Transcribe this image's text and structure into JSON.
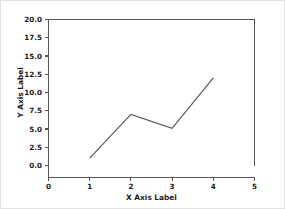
{
  "chart_data": {
    "type": "line",
    "title": "",
    "xlabel": "X Axis Label",
    "ylabel": "Y Axis Label",
    "xlim": [
      0,
      5
    ],
    "ylim": [
      0.0,
      20.0
    ],
    "grid": false,
    "legend": null,
    "x": [
      1,
      2,
      3,
      4
    ],
    "values": [
      1.0,
      7.0,
      5.1,
      12.0
    ],
    "series": [
      {
        "name": "series-1",
        "x": [
          1,
          2,
          3,
          4
        ],
        "values": [
          1.0,
          7.0,
          5.1,
          12.0
        ],
        "color": "#555555"
      }
    ],
    "xticks": [
      0,
      1,
      2,
      3,
      4,
      5
    ],
    "xtick_labels": [
      "0",
      "1",
      "2",
      "3",
      "4",
      "5"
    ],
    "yticks": [
      0.0,
      2.5,
      5.0,
      7.5,
      10.0,
      12.5,
      15.0,
      17.5,
      20.0
    ],
    "ytick_labels": [
      "0.0",
      "2.5",
      "5.0",
      "7.5",
      "10.0",
      "12.5",
      "15.0",
      "17.5",
      "20.0"
    ]
  },
  "figure": {
    "background_color": "#ffffff",
    "border_color": "#e2e2e2",
    "axis_color": "#555555",
    "text_color": "#1a1a1a"
  }
}
